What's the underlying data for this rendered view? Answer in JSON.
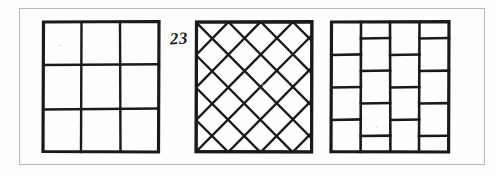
{
  "plate": {
    "annotation": "23",
    "background_color": "#fdfdfb",
    "frame_color": "#b9b9b9",
    "ink_color": "#1a1a1a",
    "width": 497,
    "height": 176
  },
  "figures": [
    {
      "id": "square-grid",
      "name": "3x3 square grid tiling",
      "pattern": "grid",
      "rows": 3,
      "cols": 3,
      "x": 40,
      "y": 19,
      "size": 122
    },
    {
      "id": "diamond-lattice",
      "name": "diagonal diamond lattice tiling",
      "pattern": "diagonal-lattice",
      "divisions": 4,
      "x": 193,
      "y": 19,
      "size": 122
    },
    {
      "id": "running-bond",
      "name": "staggered brick running bond tiling",
      "pattern": "running-bond",
      "cols": 4,
      "rows": 4,
      "offset": 0.5,
      "x": 328,
      "y": 19,
      "size": 124
    }
  ]
}
